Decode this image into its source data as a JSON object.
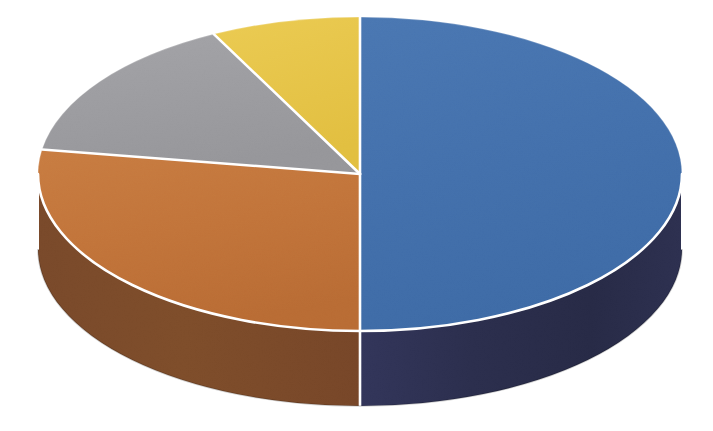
{
  "chart": {
    "type": "pie",
    "title": "",
    "style_name": "3d-exploded-disc-pie-chart",
    "background_color": "#ffffff",
    "separator_color": "#ffffff"
  },
  "chart_data": {
    "type": "pie",
    "title": "",
    "subtitle": "",
    "xlabel": "",
    "ylabel": "",
    "legend": "none",
    "grid": false,
    "three_d": true,
    "depth_px": 75,
    "start_angle_deg": 0,
    "direction": "clockwise",
    "categories": [
      "Series 1",
      "Series 2",
      "Series 3",
      "Series 4"
    ],
    "values": [
      50.0,
      27.5,
      15.0,
      7.5
    ],
    "value_unit": "percent",
    "colors": [
      "#4370AC",
      "#C2743A",
      "#9B9B9F",
      "#E7C548"
    ],
    "side_colors": [
      "#2A2C4B",
      "#7C4B29",
      "#5E5E62",
      "#A08430"
    ],
    "slices": [
      {
        "label": "Series 1",
        "value": 50.0,
        "percent": "50%",
        "top_color": "#4370AC",
        "side_color": "#2A2C4B",
        "start_deg": 0,
        "end_deg": 180,
        "position": "right-half"
      },
      {
        "label": "Series 2",
        "value": 27.5,
        "percent": "27.5%",
        "top_color": "#C2743A",
        "side_color": "#7C4B29",
        "start_deg": 180,
        "end_deg": 279,
        "position": "lower-left"
      },
      {
        "label": "Series 3",
        "value": 15.0,
        "percent": "15%",
        "top_color": "#9B9B9F",
        "side_color": "#5E5E62",
        "start_deg": 279,
        "end_deg": 333,
        "position": "upper-left"
      },
      {
        "label": "Series 4",
        "value": 7.5,
        "percent": "7.5%",
        "top_color": "#E7C548",
        "side_color": "#A08430",
        "start_deg": 333,
        "end_deg": 360,
        "position": "top"
      }
    ],
    "geometry": {
      "center_x": 360,
      "center_y": 174,
      "radius_x": 322,
      "radius_y": 157,
      "depth": 75
    }
  }
}
